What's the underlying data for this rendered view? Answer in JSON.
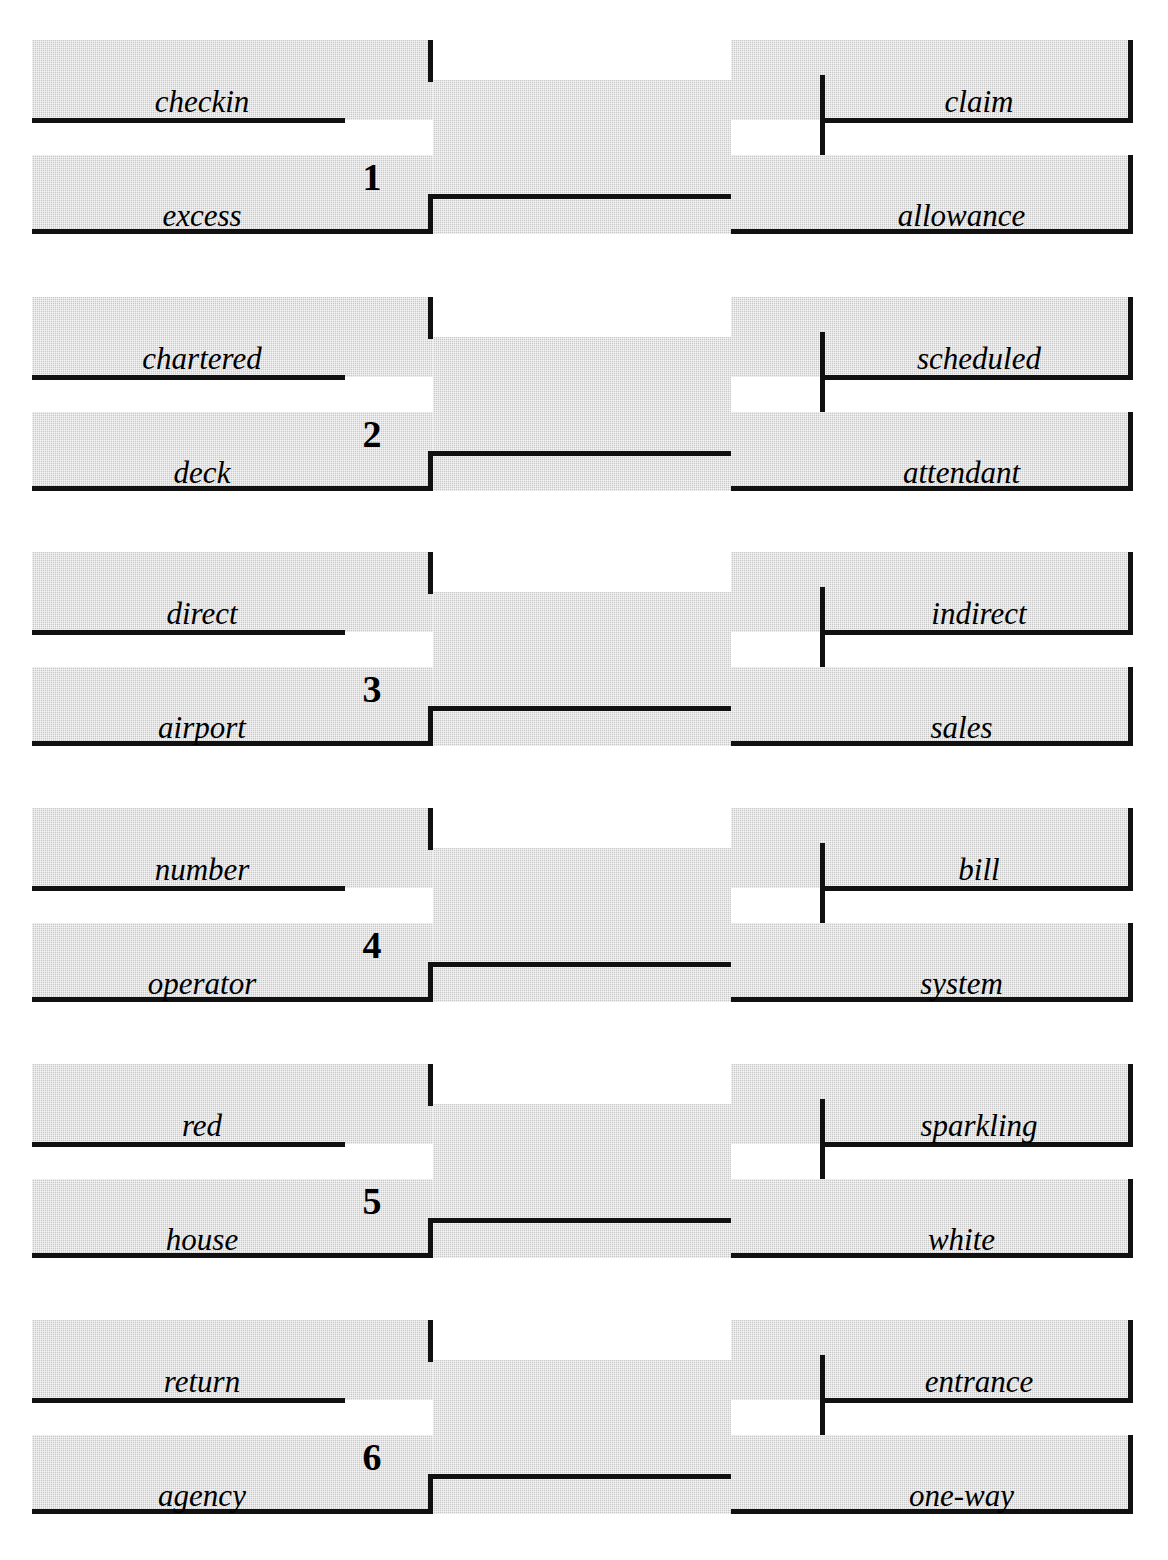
{
  "puzzle": {
    "type": "word-association-puzzle",
    "background_color": "#ffffff",
    "panel_color": "#c9c9c9",
    "rule_color": "#111111",
    "rows": [
      {
        "number": "1",
        "top_left": "checkin",
        "bottom_left": "excess",
        "top_right": "claim",
        "bottom_right": "allowance"
      },
      {
        "number": "2",
        "top_left": "chartered",
        "bottom_left": "deck",
        "top_right": "scheduled",
        "bottom_right": "attendant"
      },
      {
        "number": "3",
        "top_left": "direct",
        "bottom_left": "airport",
        "top_right": "indirect",
        "bottom_right": "sales"
      },
      {
        "number": "4",
        "top_left": "number",
        "bottom_left": "operator",
        "top_right": "bill",
        "bottom_right": "system"
      },
      {
        "number": "5",
        "top_left": "red",
        "bottom_left": "house",
        "top_right": "sparkling",
        "bottom_right": "white"
      },
      {
        "number": "6",
        "top_left": "return",
        "bottom_left": "agency",
        "top_right": "entrance",
        "bottom_right": "one-way"
      }
    ]
  }
}
